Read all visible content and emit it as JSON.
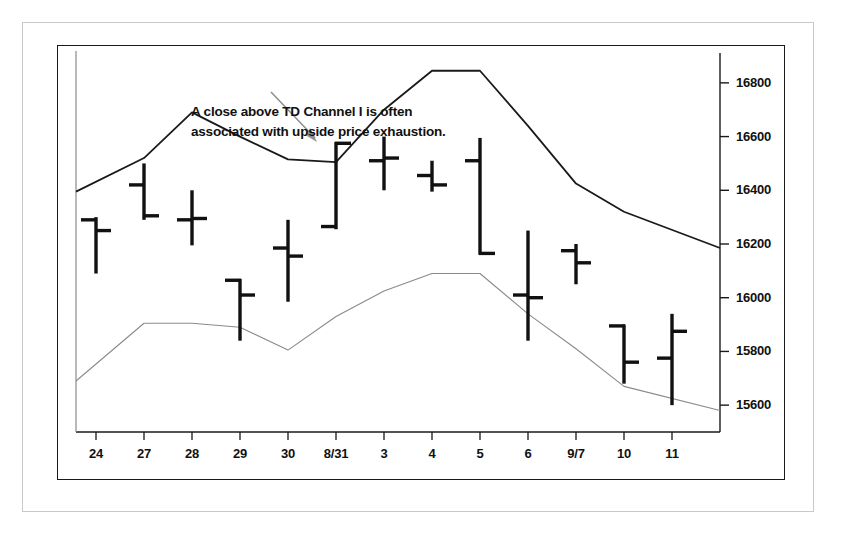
{
  "annotation": {
    "line1": "A close above TD Channel I is often",
    "line2": "associated with upside price exhaustion.",
    "arrow": "arrow-pointer"
  },
  "chart_data": {
    "type": "ohlc",
    "title": "",
    "xlabel": "",
    "ylabel": "",
    "grid": false,
    "legend": "none",
    "ylim": [
      15500,
      16900
    ],
    "yticks": [
      16800,
      16600,
      16400,
      16200,
      16000,
      15800,
      15600
    ],
    "ytick_labels": [
      "16800",
      "16600",
      "16400",
      "16200",
      "16000",
      "15800",
      "15600"
    ],
    "categories": [
      "24",
      "27",
      "28",
      "29",
      "30",
      "8/31",
      "3",
      "4",
      "5",
      "6",
      "9/7",
      "10",
      "11"
    ],
    "bars": [
      {
        "label": "24",
        "open": 16290,
        "high": 16300,
        "low": 16090,
        "close": 16250
      },
      {
        "label": "27",
        "open": 16420,
        "high": 16500,
        "low": 16290,
        "close": 16305
      },
      {
        "label": "28",
        "open": 16290,
        "high": 16400,
        "low": 16195,
        "close": 16295
      },
      {
        "label": "29",
        "open": 16065,
        "high": 16070,
        "low": 15840,
        "close": 16010
      },
      {
        "label": "30",
        "open": 16185,
        "high": 16290,
        "low": 15985,
        "close": 16155
      },
      {
        "label": "8/31",
        "open": 16265,
        "high": 16580,
        "low": 16255,
        "close": 16575
      },
      {
        "label": "3",
        "open": 16510,
        "high": 16600,
        "low": 16400,
        "close": 16520
      },
      {
        "label": "4",
        "open": 16455,
        "high": 16510,
        "low": 16395,
        "close": 16420
      },
      {
        "label": "5",
        "open": 16510,
        "high": 16595,
        "low": 16160,
        "close": 16165
      },
      {
        "label": "6",
        "open": 16010,
        "high": 16250,
        "low": 15840,
        "close": 16000
      },
      {
        "label": "9/7",
        "open": 16175,
        "high": 16200,
        "low": 16050,
        "close": 16130
      },
      {
        "label": "10",
        "open": 15895,
        "high": 15900,
        "low": 15680,
        "close": 15760
      },
      {
        "label": "11",
        "open": 15775,
        "high": 15940,
        "low": 15600,
        "close": 15875
      }
    ],
    "series": [
      {
        "name": "TD Channel I (upper)",
        "color": "#1a1a1a",
        "values": [
          16395,
          16520,
          16690,
          16600,
          16515,
          16505,
          16700,
          16845,
          16845,
          16640,
          16425,
          16320,
          16185
        ]
      },
      {
        "name": "TD Channel II (lower)",
        "color": "#8a8a8a",
        "values": [
          15690,
          15905,
          15905,
          15890,
          15805,
          15930,
          16025,
          16090,
          16090,
          15940,
          15810,
          15670,
          15580
        ]
      }
    ]
  }
}
